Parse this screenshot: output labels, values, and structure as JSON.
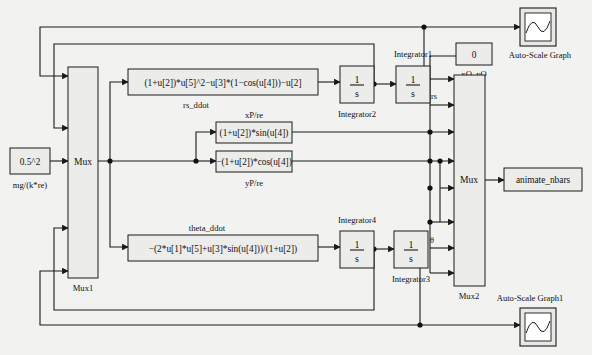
{
  "diagram": {
    "background_color": "#f2f2f0",
    "block_fill": "#ececea",
    "line_color": "#1a1a1a"
  },
  "blocks": {
    "constant_input": {
      "value": "0.5^2",
      "label": "mg/(k*re)"
    },
    "constant_origin": {
      "value": "0",
      "label": "xO, yO"
    },
    "mux1": {
      "text": "Mux",
      "label": "Mux1",
      "inputs": 5
    },
    "mux2": {
      "text": "Mux",
      "label": "Mux2",
      "inputs": 7
    },
    "fcn_rs_ddot": {
      "expr": "(1+u[2])*u[5]^2−u[3]*(1−cos(u[4]))−u[2]",
      "label": "rs_ddot"
    },
    "fcn_xp": {
      "expr": "(1+u[2])*sin(u[4])",
      "label": "xP/re"
    },
    "fcn_yp": {
      "expr": "−(1+u[2])*cos(u[4])",
      "label": "yP/re"
    },
    "fcn_theta_ddot": {
      "expr": "−(2*u[1]*u[5]+u[3]*sin(u[4]))/(1+u[2])",
      "label": "theta_ddot"
    },
    "integrator2": {
      "numerator": "1",
      "denominator": "s",
      "label": "Integrator2"
    },
    "integrator1": {
      "numerator": "1",
      "denominator": "s",
      "label": "Integrator1"
    },
    "integrator4": {
      "numerator": "1",
      "denominator": "s",
      "label": "Integrator4"
    },
    "integrator3": {
      "numerator": "1",
      "denominator": "s",
      "label": "Integrator3"
    },
    "animate": {
      "text": "animate_nbars"
    },
    "scope_top": {
      "label": "Auto-Scale Graph"
    },
    "scope_bottom": {
      "label": "Auto-Scale Graph1"
    }
  },
  "signals": {
    "rs": "rs",
    "theta": "θ"
  }
}
